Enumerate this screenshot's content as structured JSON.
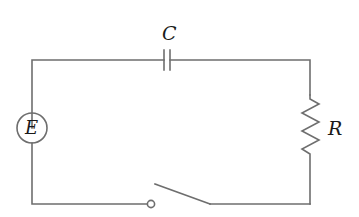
{
  "diagram": {
    "type": "circuit",
    "components": {
      "capacitor": {
        "label": "C"
      },
      "resistor": {
        "label": "R"
      },
      "emf_source": {
        "label": "E"
      },
      "switch": {
        "state": "open"
      }
    },
    "colors": {
      "wire": "#6e6e6e",
      "label": "#1a1a1a",
      "background": "#ffffff"
    }
  }
}
